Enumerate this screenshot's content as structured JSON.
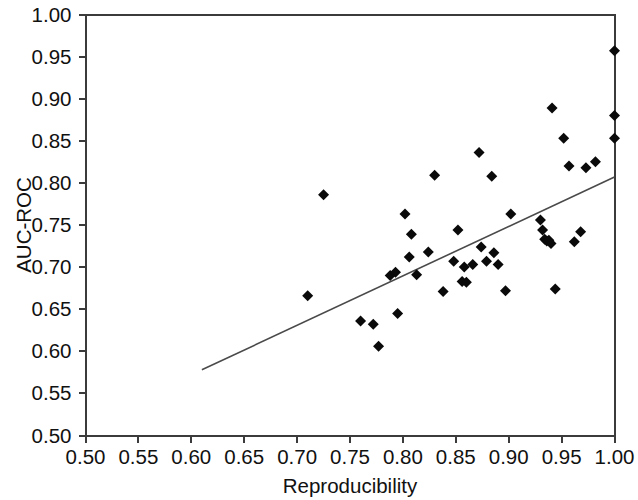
{
  "chart_data": {
    "type": "scatter",
    "title": "",
    "xlabel": "Reproducibility",
    "ylabel": "AUC-ROC",
    "xlim": [
      0.5,
      1.0
    ],
    "ylim": [
      0.5,
      1.0
    ],
    "xticks": [
      "0.50",
      "0.55",
      "0.60",
      "0.65",
      "0.70",
      "0.75",
      "0.80",
      "0.85",
      "0.90",
      "0.95",
      "1.00"
    ],
    "yticks": [
      "0.50",
      "0.55",
      "0.60",
      "0.65",
      "0.70",
      "0.75",
      "0.80",
      "0.85",
      "0.90",
      "0.95",
      "1.00"
    ],
    "xtick_values": [
      0.5,
      0.55,
      0.6,
      0.65,
      0.7,
      0.75,
      0.8,
      0.85,
      0.9,
      0.95,
      1.0
    ],
    "ytick_values": [
      0.5,
      0.55,
      0.6,
      0.65,
      0.7,
      0.75,
      0.8,
      0.85,
      0.9,
      0.95,
      1.0
    ],
    "grid": false,
    "legend": null,
    "marker_style": "diamond",
    "marker_color": "#0a0a0a",
    "marker_size": 11,
    "points": [
      [
        0.71,
        0.666
      ],
      [
        0.725,
        0.786
      ],
      [
        0.76,
        0.636
      ],
      [
        0.772,
        0.632
      ],
      [
        0.777,
        0.606
      ],
      [
        0.788,
        0.69
      ],
      [
        0.793,
        0.694
      ],
      [
        0.795,
        0.645
      ],
      [
        0.802,
        0.763
      ],
      [
        0.806,
        0.712
      ],
      [
        0.808,
        0.739
      ],
      [
        0.813,
        0.691
      ],
      [
        0.824,
        0.718
      ],
      [
        0.83,
        0.809
      ],
      [
        0.838,
        0.671
      ],
      [
        0.848,
        0.707
      ],
      [
        0.852,
        0.744
      ],
      [
        0.856,
        0.683
      ],
      [
        0.858,
        0.7
      ],
      [
        0.86,
        0.682
      ],
      [
        0.866,
        0.703
      ],
      [
        0.872,
        0.836
      ],
      [
        0.874,
        0.724
      ],
      [
        0.879,
        0.707
      ],
      [
        0.884,
        0.808
      ],
      [
        0.886,
        0.717
      ],
      [
        0.89,
        0.703
      ],
      [
        0.897,
        0.672
      ],
      [
        0.902,
        0.763
      ],
      [
        0.93,
        0.756
      ],
      [
        0.932,
        0.744
      ],
      [
        0.934,
        0.733
      ],
      [
        0.936,
        0.731
      ],
      [
        0.938,
        0.732
      ],
      [
        0.94,
        0.728
      ],
      [
        0.941,
        0.889
      ],
      [
        0.944,
        0.674
      ],
      [
        0.952,
        0.853
      ],
      [
        0.957,
        0.82
      ],
      [
        0.962,
        0.73
      ],
      [
        0.968,
        0.742
      ],
      [
        0.973,
        0.818
      ],
      [
        0.982,
        0.825
      ],
      [
        1.0,
        0.957
      ],
      [
        1.0,
        0.88
      ],
      [
        1.0,
        0.853
      ]
    ],
    "trendline": {
      "type": "linear-fit",
      "x0": 0.61,
      "y0": 0.578,
      "x1": 1.0,
      "y1": 0.807,
      "color": "#4a4a4a"
    }
  }
}
